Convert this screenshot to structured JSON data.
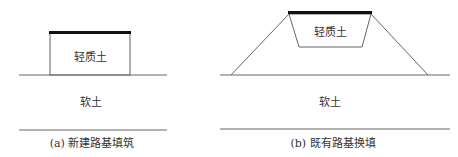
{
  "panel_a": {
    "fill_label": "轻质土",
    "soil_label": "软土",
    "caption": "(a) 新建路基填筑"
  },
  "panel_b": {
    "fill_label": "轻质土",
    "soil_label": "软土",
    "caption": "(b) 既有路基换填"
  }
}
